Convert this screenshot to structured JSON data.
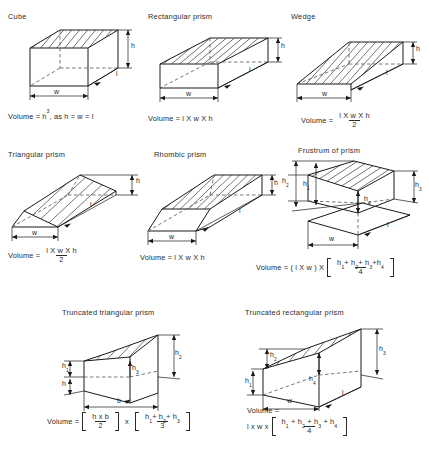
{
  "document": {
    "kind": "engineering-reference-figure",
    "subject": "Volumes of prisms and wedges"
  },
  "panels": [
    {
      "id": "cube",
      "title": "Cube",
      "dimensions": [
        "h",
        "l",
        "w"
      ],
      "formula_text": "Volume = h3, as h = w = l",
      "formula": {
        "lead": "Volume =",
        "base": "h",
        "exponent": "3",
        "tail": ", as h = w = l"
      }
    },
    {
      "id": "rectangular-prism",
      "title": "Rectangular prism",
      "dimensions": [
        "h",
        "l",
        "w"
      ],
      "formula_text": "Volume = l X w X h",
      "formula": {
        "lead": "Volume =",
        "body": "l X w X h"
      }
    },
    {
      "id": "wedge",
      "title": "Wedge",
      "dimensions": [
        "h",
        "l",
        "w"
      ],
      "formula_text": "Volume = (l X w X h) / 2",
      "formula": {
        "lead": "Volume =",
        "numerator": "l X w X h",
        "denominator": "2"
      }
    },
    {
      "id": "triangular-prism",
      "title": "Triangular prism",
      "dimensions": [
        "h",
        "l",
        "w"
      ],
      "formula_text": "Volume = (l X w X h) / 2",
      "formula": {
        "lead": "Volume =",
        "numerator": "l X w X h",
        "denominator": "2"
      }
    },
    {
      "id": "rhombic-prism",
      "title": "Rhombic prism",
      "dimensions": [
        "h",
        "l",
        "w"
      ],
      "formula_text": "Volume = l X w X h",
      "formula": {
        "lead": "Volume =",
        "body": "l X w X h"
      }
    },
    {
      "id": "frustrum-of-prism",
      "title": "Frustrum of prism",
      "dimensions": [
        "h1",
        "h2",
        "h3",
        "h4",
        "l",
        "w"
      ],
      "formula_text": "Volume = (l X w) X [ (h1 + h2 + h3 + h4) / 4 ]",
      "formula": {
        "lead": "Volume = ( l X w ) X",
        "numerator_terms": [
          "h",
          "1",
          "h",
          "2",
          "h",
          "3",
          "h",
          "4"
        ],
        "denominator": "4"
      }
    },
    {
      "id": "truncated-triangular-prism",
      "title": "Truncated triangular prism",
      "dimensions": [
        "h",
        "h1",
        "h2",
        "h3",
        "b"
      ],
      "formula_text": "Volume = [ (h x b) / 2 ] x [ (h1 + h2 + h3) / 3 ]",
      "formula": {
        "lead": "Volume =",
        "first_numerator": "h x b",
        "first_denominator": "2",
        "operator": "x",
        "second_denominator": "3"
      }
    },
    {
      "id": "truncated-rectangular-prism",
      "title": "Truncated rectangular prism",
      "dimensions": [
        "h1",
        "h2",
        "h3",
        "h4",
        "l",
        "w"
      ],
      "formula_text": "Volume = l x w x [ (h1 + h2 + h3 + h4) / 4 ]",
      "formula": {
        "lead": "Volume =",
        "body": "l x w x",
        "denominator": "4"
      }
    }
  ],
  "labels": {
    "h": "h",
    "l": "l",
    "w": "w",
    "b": "b",
    "volume": "Volume",
    "equals": "=",
    "times_cap": "X",
    "times_low": "x",
    "plus": "+",
    "comma_as": ", as h = w = l",
    "h_sub1": "1",
    "h_sub2": "2",
    "h_sub3": "3",
    "h_sub4": "4",
    "two": "2",
    "three": "3",
    "four": "4",
    "cube_exp": "3",
    "paren_lw": "( l X w ) X"
  },
  "colors": {
    "background": "#ffffff",
    "line": "#1a1a1a",
    "hidden_line": "#555555",
    "text": "#2a2a2a"
  }
}
